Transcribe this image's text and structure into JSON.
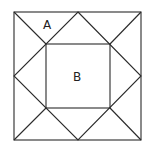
{
  "diagram": {
    "type": "quilt-block-geometry",
    "labels": {
      "a": "A",
      "b": "B"
    },
    "colors": {
      "stroke": "#2a2a2a",
      "background": "#ffffff",
      "text": "#222222"
    },
    "shapes": {
      "outer_square": {
        "x1": 14,
        "y1": 12,
        "x2": 141,
        "y2": 140
      },
      "inner_square": {
        "x1": 46,
        "y1": 44,
        "x2": 110,
        "y2": 108
      },
      "diamond": [
        [
          78,
          12
        ],
        [
          141,
          76
        ],
        [
          78,
          140
        ],
        [
          14,
          76
        ]
      ]
    }
  }
}
